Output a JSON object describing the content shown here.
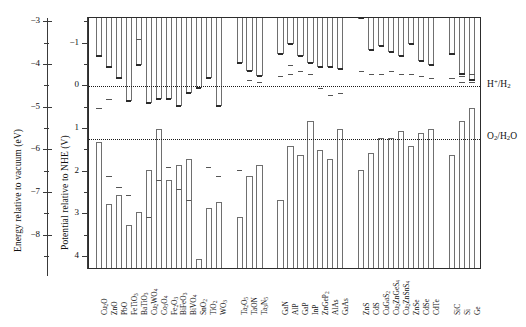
{
  "figure": {
    "left_axis_title": "Energy relative to vacuum (eV)",
    "right_axis_title": "Potential relative to NHE (V)",
    "redox_labels": {
      "hydrogen": "H+/H2",
      "oxygen": "O2/H2O"
    }
  },
  "chart_data": {
    "type": "bar",
    "xlabel": "",
    "ylabel": "Potential relative to NHE (V)",
    "y2label": "Energy relative to vacuum (eV)",
    "ylim": [
      -1.6,
      4.3
    ],
    "y2lim": [
      -2.9,
      -8.8
    ],
    "y_ticks_major": [
      -1,
      0,
      1,
      2,
      3,
      4
    ],
    "y_ticks_minor": [
      -1.5,
      -0.5,
      0.5,
      1.5,
      2.5,
      3.5
    ],
    "y2_ticks_major": [
      -3,
      -4,
      -5,
      -6,
      -7,
      -8
    ],
    "y2_ticks_minor": [
      -3.5,
      -4.5,
      -5.5,
      -6.5,
      -7.5,
      -8.5
    ],
    "axis_offset_vacuum_to_nhe": -4.5,
    "grid": false,
    "legend": "none",
    "reference_lines": [
      {
        "name": "H+/H2",
        "value": 0.0,
        "style": "dotted"
      },
      {
        "name": "O2/H2O",
        "value": 1.23,
        "style": "dotted"
      }
    ],
    "series_note": "Each material: conduction band edge (CB) and valence band edge (VB) in V vs NHE; extra marks are reported/alternative band-edge levels.",
    "groups": [
      {
        "name": "oxides",
        "materials": [
          {
            "label": "Cu2O",
            "label_html": "Cu<sub>2</sub>O",
            "cb": -0.7,
            "vb": 1.3,
            "marks": [
              0.5
            ]
          },
          {
            "label": "ZnO",
            "label_html": "ZnO",
            "cb": -0.45,
            "vb": 2.75,
            "marks": [
              0.3,
              2.1
            ]
          },
          {
            "label": "PbO",
            "label_html": "PbO",
            "cb": -0.2,
            "vb": 2.55,
            "marks": [
              2.35
            ]
          },
          {
            "label": "FeTiO3",
            "label_html": "FeTiO<sub>3</sub>",
            "cb": 0.35,
            "vb": 3.25,
            "marks": [
              2.55
            ]
          },
          {
            "label": "BaTiO3",
            "label_html": "BaTiO<sub>3</sub>",
            "cb": -0.5,
            "vb": 2.95,
            "marks": [
              -1.1
            ]
          },
          {
            "label": "Cu2WO4",
            "label_html": "Cu<sub>2</sub>WO<sub>4</sub>",
            "cb": 0.4,
            "vb": 1.95,
            "marks": [
              3.05
            ]
          },
          {
            "label": "Co3O4",
            "label_html": "Co<sub>3</sub>O<sub>4</sub>",
            "cb": 0.3,
            "vb": 1.0,
            "marks": [
              2.2
            ]
          },
          {
            "label": "Fe2O3",
            "label_html": "Fe<sub>2</sub>O<sub>3</sub>",
            "cb": 0.3,
            "vb": 2.2,
            "marks": [
              1.9
            ]
          },
          {
            "label": "BiFeO3",
            "label_html": "BiFeO<sub>3</sub>",
            "cb": 0.45,
            "vb": 1.85,
            "marks": [
              2.4
            ]
          },
          {
            "label": "BiVO4",
            "label_html": "BiVO<sub>4</sub>",
            "cb": 0.15,
            "vb": 1.7,
            "marks": [
              2.65
            ]
          },
          {
            "label": "SnO2",
            "label_html": "SnO<sub>2</sub>",
            "cb": 0.05,
            "vb": 4.05,
            "marks": []
          },
          {
            "label": "TiO2",
            "label_html": "TiO<sub>2</sub>",
            "cb": -0.2,
            "vb": 2.85,
            "marks": [
              1.9
            ]
          },
          {
            "label": "WO3",
            "label_html": "WO<sub>3</sub>",
            "cb": 0.45,
            "vb": 2.7,
            "marks": [
              2.1
            ]
          }
        ]
      },
      {
        "name": "tantalates-nitrides",
        "materials": [
          {
            "label": "Ta2O5",
            "label_html": "Ta<sub>2</sub>O<sub>5</sub>",
            "cb": -0.55,
            "vb": 3.05,
            "marks": [
              1.95
            ]
          },
          {
            "label": "TaON",
            "label_html": "TaON",
            "cb": -0.35,
            "vb": 2.1,
            "marks": [
              -0.15
            ]
          },
          {
            "label": "Ta3N5",
            "label_html": "Ta<sub>3</sub>N<sub>5</sub>",
            "cb": -0.25,
            "vb": 1.85,
            "marks": [
              -0.1
            ]
          }
        ]
      },
      {
        "name": "III-V",
        "materials": [
          {
            "label": "GaN",
            "label_html": "GaN",
            "cb": -0.75,
            "vb": 2.65,
            "marks": [
              -0.25
            ]
          },
          {
            "label": "AlP",
            "label_html": "AlP",
            "cb": -1.0,
            "vb": 1.4,
            "marks": [
              -0.3,
              -0.5
            ]
          },
          {
            "label": "GaP",
            "label_html": "GaP",
            "cb": -0.7,
            "vb": 1.6,
            "marks": [
              -0.35
            ]
          },
          {
            "label": "InP",
            "label_html": "InP",
            "cb": -0.55,
            "vb": 0.8,
            "marks": [
              -0.3
            ]
          },
          {
            "label": "ZnGeP2",
            "label_html": "ZnGeP<sub>2</sub>",
            "cb": -0.45,
            "vb": 1.5,
            "marks": [
              0.05
            ]
          },
          {
            "label": "AlAs",
            "label_html": "AlAs",
            "cb": -0.45,
            "vb": 1.7,
            "marks": [
              0.2
            ]
          },
          {
            "label": "GaAs",
            "label_html": "GaAs",
            "cb": -0.4,
            "vb": 1.0,
            "marks": [
              0.15
            ]
          }
        ]
      },
      {
        "name": "chalcogenides",
        "materials": [
          {
            "label": "ZnS",
            "label_html": "ZnS",
            "cb": -1.6,
            "vb": 1.95,
            "marks": [
              -0.35
            ]
          },
          {
            "label": "CdS",
            "label_html": "CdS",
            "cb": -0.85,
            "vb": 1.55,
            "marks": [
              -0.3
            ]
          },
          {
            "label": "CuGaS2",
            "label_html": "CuGaS<sub>2</sub>",
            "cb": -0.95,
            "vb": 1.2,
            "marks": [
              -0.3
            ]
          },
          {
            "label": "Cu2ZnGeS4",
            "label_html": "Cu<sub>2</sub>ZnGeS<sub>4</sub>",
            "cb": -0.8,
            "vb": 1.2,
            "marks": [
              -0.35
            ]
          },
          {
            "label": "Cu2ZnSnS4",
            "label_html": "Cu<sub>2</sub>ZnSnS<sub>4</sub>",
            "cb": -0.7,
            "vb": 1.05,
            "marks": [
              -0.3
            ]
          },
          {
            "label": "ZnSe",
            "label_html": "ZnSe",
            "cb": -1.0,
            "vb": 1.4,
            "marks": [
              -0.3
            ]
          },
          {
            "label": "CdSe",
            "label_html": "CdSe",
            "cb": -0.6,
            "vb": 1.1,
            "marks": [
              -0.25
            ]
          },
          {
            "label": "CdTe",
            "label_html": "CdTe",
            "cb": -0.5,
            "vb": 1.0,
            "marks": [
              -0.2
            ]
          }
        ]
      },
      {
        "name": "elemental",
        "materials": [
          {
            "label": "SiC",
            "label_html": "SiC",
            "cb": -0.75,
            "vb": 1.6,
            "marks": [
              -0.2
            ]
          },
          {
            "label": "Si",
            "label_html": "Si",
            "cb": -0.3,
            "vb": 0.8,
            "marks": [
              -0.25,
              -0.1
            ]
          },
          {
            "label": "Ge",
            "label_html": "Ge",
            "cb": -0.15,
            "vb": 0.5,
            "marks": [
              -0.3,
              -0.1
            ]
          }
        ]
      }
    ]
  }
}
